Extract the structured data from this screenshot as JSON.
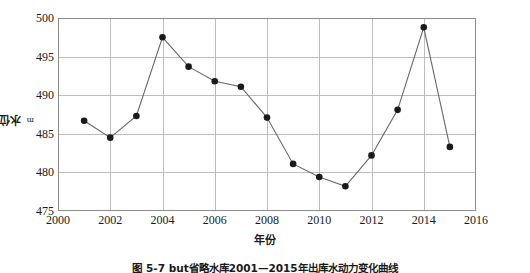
{
  "chart_data": {
    "type": "line",
    "title": "",
    "xlabel": "年份",
    "ylabel": "水位 /m",
    "ylabel_text": "水位 /",
    "ylabel_unit": "m",
    "xlim": [
      2000,
      2016
    ],
    "ylim": [
      475,
      500
    ],
    "grid": true,
    "legend": null,
    "marker": "filled-circle",
    "line_color": "#666666",
    "marker_color": "#1a1a1a",
    "grid_color": "#b5b5b5",
    "xticks": [
      2000,
      2002,
      2004,
      2006,
      2008,
      2010,
      2012,
      2014,
      2016
    ],
    "yticks": [
      475,
      480,
      485,
      490,
      495,
      500
    ],
    "x": [
      2001,
      2002,
      2003,
      2004,
      2005,
      2006,
      2007,
      2008,
      2009,
      2010,
      2011,
      2012,
      2013,
      2014,
      2015
    ],
    "values": [
      486.7,
      484.5,
      487.3,
      497.5,
      493.7,
      491.8,
      491.1,
      487.1,
      481.1,
      479.4,
      478.2,
      482.2,
      488.1,
      498.8,
      483.3
    ],
    "series": [
      {
        "name": "水位",
        "values": [
          486.7,
          484.5,
          487.3,
          497.5,
          493.7,
          491.8,
          491.1,
          487.1,
          481.1,
          479.4,
          478.2,
          482.2,
          488.1,
          498.8,
          483.3
        ]
      }
    ]
  },
  "caption": "图 5-7  but省略水库2001—2015年出库水动力变化曲线"
}
